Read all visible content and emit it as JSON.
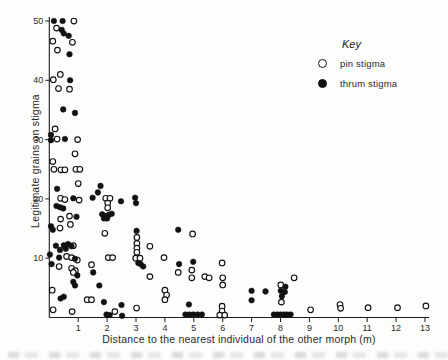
{
  "figure": {
    "y_axis": {
      "label": "Legitimate grains on stigma",
      "ticks": [
        10,
        20,
        30,
        40,
        50
      ]
    },
    "x_axis": {
      "label": "Distance to the nearest individual of the other morph (m)",
      "ticks": [
        1,
        2,
        3,
        4,
        5,
        6,
        7,
        8,
        9,
        10,
        11,
        12,
        13
      ]
    },
    "key": {
      "title": "Key",
      "items": [
        {
          "label": "pin stigma",
          "marker": "open"
        },
        {
          "label": "thrum stigma",
          "marker": "filled"
        }
      ]
    },
    "colors": {
      "ink": "#1c1c1c",
      "background": "#fdfdfc"
    }
  },
  "chart_data": {
    "type": "scatter",
    "title": "",
    "xlabel": "Distance to the nearest individual of the other morph (m)",
    "ylabel": "Legitimate grains on stigma",
    "xlim": [
      0,
      13.3
    ],
    "ylim": [
      0,
      52
    ],
    "grid": false,
    "legend_position": "upper-right",
    "series": [
      {
        "name": "pin stigma",
        "marker": "open-circle",
        "points": [
          [
            0.85,
            50
          ],
          [
            0.25,
            48.8
          ],
          [
            0.12,
            46.6
          ],
          [
            0.8,
            46.4
          ],
          [
            0.28,
            45.1
          ],
          [
            0.38,
            41.0
          ],
          [
            0.14,
            40.1
          ],
          [
            0.32,
            38.6
          ],
          [
            0.7,
            38.5
          ],
          [
            0.2,
            31.8
          ],
          [
            0.27,
            30.1
          ],
          [
            0.98,
            30.0
          ],
          [
            0.89,
            27.6
          ],
          [
            0.12,
            26.3
          ],
          [
            0.16,
            25.0
          ],
          [
            0.4,
            24.9
          ],
          [
            0.54,
            24.9
          ],
          [
            0.92,
            25.0
          ],
          [
            1.06,
            25.0
          ],
          [
            1.0,
            22.6
          ],
          [
            0.39,
            20.1
          ],
          [
            0.54,
            19.9
          ],
          [
            1.03,
            19.8
          ],
          [
            1.95,
            20.1
          ],
          [
            2.1,
            20.1
          ],
          [
            2.02,
            19.3
          ],
          [
            2.02,
            18.5
          ],
          [
            0.39,
            16.6
          ],
          [
            0.7,
            17.1
          ],
          [
            0.37,
            15.1
          ],
          [
            0.73,
            15.7
          ],
          [
            1.92,
            14.2
          ],
          [
            3.48,
            12.0
          ],
          [
            3.03,
            13.5
          ],
          [
            3.03,
            12.5
          ],
          [
            3.03,
            11.7
          ],
          [
            3.03,
            11.0
          ],
          [
            0.83,
            12.1
          ],
          [
            0.6,
            10.3
          ],
          [
            0.77,
            10.1
          ],
          [
            0.97,
            9.7
          ],
          [
            2.04,
            10.1
          ],
          [
            2.19,
            10.1
          ],
          [
            2.99,
            10.0
          ],
          [
            3.14,
            10.0
          ],
          [
            3.97,
            10.1
          ],
          [
            0.34,
            8.6
          ],
          [
            1.46,
            8.9
          ],
          [
            0.77,
            8.3
          ],
          [
            0.9,
            7.9
          ],
          [
            0.83,
            7.6
          ],
          [
            4.96,
            14.1
          ],
          [
            4.46,
            7.6
          ],
          [
            4.93,
            8.0
          ],
          [
            4.93,
            6.7
          ],
          [
            3.48,
            6.9
          ],
          [
            5.38,
            6.9
          ],
          [
            5.53,
            6.7
          ],
          [
            5.98,
            9.2
          ],
          [
            6.0,
            6.7
          ],
          [
            6.0,
            5.5
          ],
          [
            4.0,
            4.6
          ],
          [
            4.06,
            3.8
          ],
          [
            4.0,
            3.0
          ],
          [
            1.31,
            3.0
          ],
          [
            1.46,
            3.0
          ],
          [
            0.1,
            4.6
          ],
          [
            0.13,
            1.3
          ],
          [
            0.79,
            1.0
          ],
          [
            2.27,
            1.0
          ],
          [
            3.02,
            1.6
          ],
          [
            5.98,
            1.9
          ],
          [
            5.98,
            1.1
          ],
          [
            5.9,
            0.4
          ],
          [
            6.07,
            0.4
          ],
          [
            8.47,
            6.7
          ],
          [
            8.01,
            5.5
          ],
          [
            8.03,
            2.6
          ],
          [
            9.04,
            1.3
          ],
          [
            10.06,
            2.2
          ],
          [
            10.08,
            1.55
          ],
          [
            11.03,
            1.65
          ],
          [
            12.05,
            1.65
          ],
          [
            13.03,
            1.95
          ]
        ]
      },
      {
        "name": "thrum stigma",
        "marker": "filled-circle",
        "points": [
          [
            0.16,
            50
          ],
          [
            0.46,
            50
          ],
          [
            0.43,
            48.5
          ],
          [
            0.5,
            47.9
          ],
          [
            0.67,
            47.5
          ],
          [
            0.7,
            44.4
          ],
          [
            0.72,
            40.0
          ],
          [
            0.48,
            35.1
          ],
          [
            0.89,
            34.5
          ],
          [
            0.06,
            30.8
          ],
          [
            0.06,
            29.9
          ],
          [
            0.54,
            30.1
          ],
          [
            0.27,
            21.7
          ],
          [
            1.77,
            22.2
          ],
          [
            1.68,
            21.1
          ],
          [
            1.5,
            20.2
          ],
          [
            2.48,
            19.6
          ],
          [
            2.97,
            20.2
          ],
          [
            3.0,
            19.3
          ],
          [
            0.83,
            20.1
          ],
          [
            1.83,
            17.4
          ],
          [
            1.95,
            17.1
          ],
          [
            2.06,
            17.3
          ],
          [
            2.16,
            17.5
          ],
          [
            1.89,
            16.7
          ],
          [
            2.0,
            16.7
          ],
          [
            0.25,
            18.8
          ],
          [
            0.37,
            18.6
          ],
          [
            0.48,
            18.4
          ],
          [
            0.94,
            17.0
          ],
          [
            0.06,
            15.4
          ],
          [
            0.12,
            14.8
          ],
          [
            3.02,
            14.6
          ],
          [
            4.46,
            14.8
          ],
          [
            0.23,
            12.1
          ],
          [
            0.5,
            12.2
          ],
          [
            0.65,
            12.4
          ],
          [
            0.77,
            12.0
          ],
          [
            0.57,
            11.6
          ],
          [
            0.37,
            11.4
          ],
          [
            0.02,
            10.6
          ],
          [
            0.34,
            10.1
          ],
          [
            0.89,
            9.9
          ],
          [
            0.08,
            9.0
          ],
          [
            3.08,
            9.2
          ],
          [
            3.16,
            9.0
          ],
          [
            3.25,
            8.6
          ],
          [
            4.49,
            9.0
          ],
          [
            4.98,
            9.4
          ],
          [
            0.97,
            7.1
          ],
          [
            0.83,
            6.0
          ],
          [
            0.89,
            5.4
          ],
          [
            1.52,
            7.6
          ],
          [
            1.73,
            5.4
          ],
          [
            0.39,
            3.2
          ],
          [
            0.5,
            3.5
          ],
          [
            1.89,
            2.6
          ],
          [
            1.98,
            0.5
          ],
          [
            2.09,
            0.4
          ],
          [
            2.5,
            2.1
          ],
          [
            2.52,
            0.3
          ],
          [
            4.83,
            2.2
          ],
          [
            4.71,
            0.5
          ],
          [
            4.85,
            0.5
          ],
          [
            4.98,
            0.5
          ],
          [
            5.13,
            0.5
          ],
          [
            5.28,
            0.5
          ],
          [
            7.0,
            4.5
          ],
          [
            7.48,
            4.4
          ],
          [
            7.0,
            2.9
          ],
          [
            8.17,
            5.2
          ],
          [
            8.01,
            4.5
          ],
          [
            8.15,
            4.3
          ],
          [
            8.05,
            3.6
          ],
          [
            7.77,
            0.5
          ],
          [
            7.89,
            0.5
          ],
          [
            8.0,
            0.5
          ],
          [
            8.12,
            0.5
          ],
          [
            8.23,
            0.5
          ],
          [
            8.35,
            0.5
          ]
        ]
      }
    ]
  }
}
